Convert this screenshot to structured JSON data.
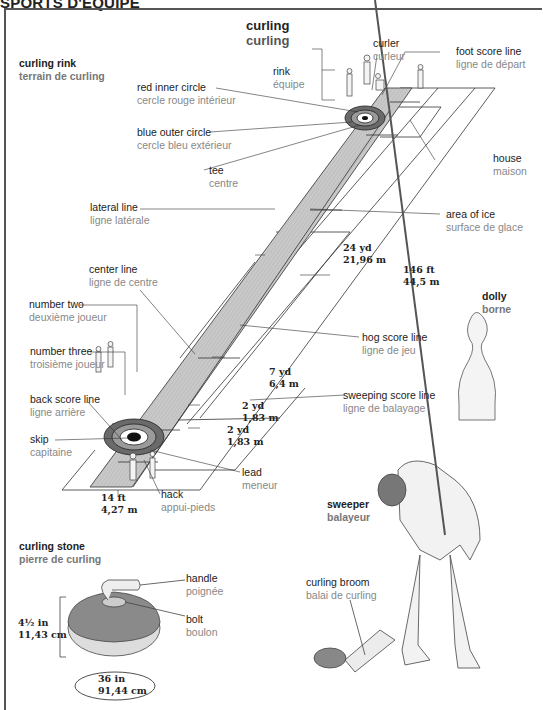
{
  "header": {
    "section": "SPORTS D'ÉQUIPE"
  },
  "title": {
    "en": "curling",
    "fr": "curling"
  },
  "colors": {
    "ice": "#c9c9c9",
    "house_red": "#6a6a6a",
    "house_blue": "#9a9a9a",
    "label_en": "#222222",
    "label_fr": "#888888",
    "frame": "#555555"
  },
  "sections": {
    "rink": {
      "en": "curling rink",
      "fr": "terrain de curling"
    },
    "dolly": {
      "en": "dolly",
      "fr": "borne"
    },
    "sweeper": {
      "en": "sweeper",
      "fr": "balayeur"
    },
    "stone": {
      "en": "curling stone",
      "fr": "pierre de curling"
    }
  },
  "labels": {
    "curler": {
      "en": "curler",
      "fr": "curleur"
    },
    "foot_score_line": {
      "en": "foot score line",
      "fr": "ligne de départ"
    },
    "rink": {
      "en": "rink",
      "fr": "équipe"
    },
    "red_inner_circle": {
      "en": "red inner circle",
      "fr": "cercle rouge intérieur"
    },
    "blue_outer_circle": {
      "en": "blue outer circle",
      "fr": "cercle bleu extérieur"
    },
    "tee": {
      "en": "tee",
      "fr": "centre"
    },
    "house": {
      "en": "house",
      "fr": "maison"
    },
    "lateral_line": {
      "en": "lateral line",
      "fr": "ligne latérale"
    },
    "area_of_ice": {
      "en": "area of ice",
      "fr": "surface de glace"
    },
    "center_line": {
      "en": "center line",
      "fr": "ligne de centre"
    },
    "number_two": {
      "en": "number two",
      "fr": "deuxième joueur"
    },
    "number_three": {
      "en": "number three",
      "fr": "troisième joueur"
    },
    "hog_score_line": {
      "en": "hog score line",
      "fr": "ligne de jeu"
    },
    "back_score_line": {
      "en": "back score line",
      "fr": "ligne arrière"
    },
    "sweeping_score_line": {
      "en": "sweeping score line",
      "fr": "ligne de balayage"
    },
    "skip": {
      "en": "skip",
      "fr": "capitaine"
    },
    "lead": {
      "en": "lead",
      "fr": "meneur"
    },
    "hack": {
      "en": "hack",
      "fr": "appui-pieds"
    },
    "handle": {
      "en": "handle",
      "fr": "poignée"
    },
    "bolt": {
      "en": "bolt",
      "fr": "boulon"
    },
    "curling_broom": {
      "en": "curling broom",
      "fr": "balai de curling"
    }
  },
  "measurements": {
    "tee_to_hog": {
      "imperial": "24 yd",
      "metric": "21,96 m"
    },
    "rink_length": {
      "imperial": "146 ft",
      "metric": "44,5 m"
    },
    "hog_to_sweep": {
      "imperial": "7 yd",
      "metric": "6,4 m"
    },
    "sweep_to_tee": {
      "imperial": "2 yd",
      "metric": "1,83 m"
    },
    "tee_to_back": {
      "imperial": "2 yd",
      "metric": "1,83 m"
    },
    "rink_width": {
      "imperial": "14 ft",
      "metric": "4,27 m"
    },
    "stone_height": {
      "imperial": "4½ in",
      "metric": "11,43 cm"
    },
    "stone_circumference": {
      "imperial": "36 in",
      "metric": "91,44 cm"
    }
  }
}
